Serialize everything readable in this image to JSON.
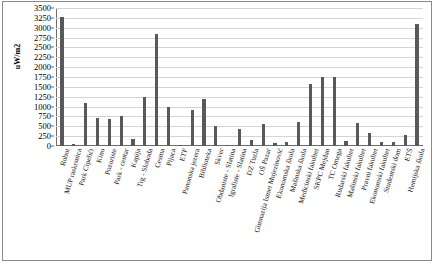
{
  "chart_data": {
    "type": "bar",
    "title": "",
    "xlabel": "",
    "ylabel": "uW/m2",
    "ylim": [
      0,
      3500
    ],
    "ytick_step": 250,
    "grid": true,
    "legend": false,
    "bar_color": "#595959",
    "yticks": [
      "3500",
      "3250",
      "3000",
      "2750",
      "2500",
      "2250",
      "2000",
      "1750",
      "1500",
      "1250",
      "1000",
      "750",
      "500",
      "250",
      "0"
    ],
    "categories": [
      "Robot",
      "MUP raskrsnica",
      "Park Cipelići",
      "Kino",
      "Pozoriste",
      "Park - centar",
      "Kapija",
      "Trg - Sloboda",
      "Cesma",
      "Pijaca",
      "ETF",
      "Panonska jezera",
      "Biblioteka",
      "Skver",
      "Obdaniste - Slatina",
      "Igraliste - Slatina",
      "DZ Tuzla",
      "OŠ Pazar",
      "Gimnazija Ismet Mujezinović",
      "Ekonomska škola",
      "Mašinska škola",
      "Medicinski fakultet",
      "SKPC Mejdan",
      "TC Omega",
      "Rudarski fakultet",
      "Mašinski fakultet",
      "Pravni fakultet",
      "Ekonomski fakultet",
      "Studentski dom",
      "ETŠ",
      "Hemijska škola"
    ],
    "values": [
      3260,
      40,
      1100,
      700,
      680,
      750,
      170,
      1250,
      2830,
      1000,
      30,
      920,
      1180,
      520,
      25,
      420,
      150,
      560,
      70,
      90,
      620,
      1570,
      1760,
      1760,
      130,
      580,
      330,
      110,
      100,
      290,
      3100
    ]
  }
}
